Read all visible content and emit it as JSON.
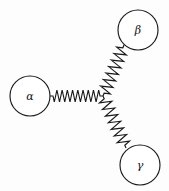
{
  "figure": {
    "background_color": "#fdfdfd",
    "stroke_color": "#1a1a1a",
    "fill_color": "#ffffff",
    "width": 169,
    "height": 191
  },
  "junction": {
    "label": "center-junction",
    "x": 103,
    "y": 96
  },
  "nodes": [
    {
      "id": "alpha",
      "label": "α",
      "cx": 30,
      "cy": 96,
      "r": 20,
      "name": "node-alpha"
    },
    {
      "id": "beta",
      "label": "β",
      "cx": 138,
      "cy": 30,
      "r": 20,
      "name": "node-beta"
    },
    {
      "id": "gamma",
      "label": "γ",
      "cx": 140,
      "cy": 165,
      "r": 20,
      "name": "node-gamma"
    }
  ],
  "springs": [
    {
      "id": "spring-alpha",
      "from": "alpha",
      "to": "junction",
      "x1": 50,
      "y1": 96,
      "x2": 103,
      "y2": 96,
      "coils": 9,
      "amplitude": 6
    },
    {
      "id": "spring-beta",
      "from": "junction",
      "to": "beta",
      "x1": 103,
      "y1": 96,
      "x2": 124,
      "y2": 45,
      "coils": 7,
      "amplitude": 6
    },
    {
      "id": "spring-gamma",
      "from": "junction",
      "to": "gamma",
      "x1": 103,
      "y1": 96,
      "x2": 126,
      "y2": 148,
      "coils": 7,
      "amplitude": 6
    }
  ]
}
